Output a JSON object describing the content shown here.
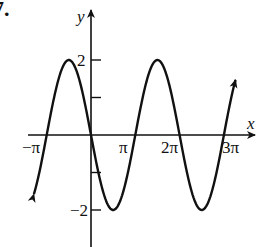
{
  "problem_number": "7.",
  "chart_data": {
    "type": "line",
    "title": "",
    "function": "y = -2 sin(x)",
    "xlabel": "x",
    "ylabel": "y",
    "x_ticks": [
      {
        "value": -3.14159,
        "label": "−π"
      },
      {
        "value": 3.14159,
        "label": "π"
      },
      {
        "value": 6.28319,
        "label": "2π"
      },
      {
        "value": 9.42478,
        "label": "3π"
      }
    ],
    "y_ticks": [
      {
        "value": 2,
        "label": "2"
      },
      {
        "value": 1,
        "label": ""
      },
      {
        "value": -1,
        "label": ""
      },
      {
        "value": -2,
        "label": "−2"
      }
    ],
    "xlim": [
      -4.0,
      11.5
    ],
    "ylim": [
      -2.9,
      3.3
    ],
    "domain": [
      -4.05,
      10.25
    ],
    "grid": false,
    "legend": null,
    "series": [
      {
        "name": "y = -2 sin(x)",
        "key_points": [
          {
            "x": -3.14159,
            "y": 0
          },
          {
            "x": -1.5708,
            "y": 2
          },
          {
            "x": 0,
            "y": 0
          },
          {
            "x": 1.5708,
            "y": -2
          },
          {
            "x": 3.14159,
            "y": 0
          },
          {
            "x": 4.71239,
            "y": 2
          },
          {
            "x": 6.28319,
            "y": 0
          },
          {
            "x": 7.85398,
            "y": -2
          },
          {
            "x": 9.42478,
            "y": 0
          }
        ],
        "arrows_at_ends": true
      }
    ]
  },
  "colors": {
    "ink": "#111111",
    "background": "#ffffff"
  }
}
